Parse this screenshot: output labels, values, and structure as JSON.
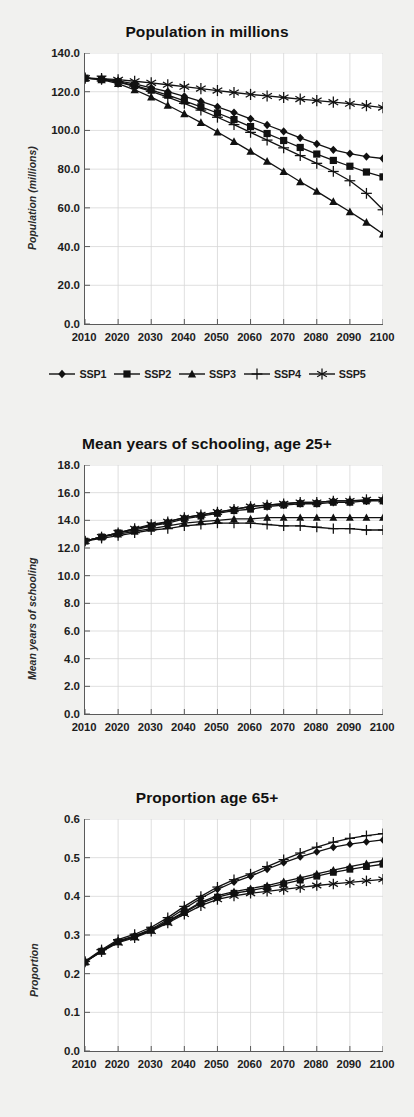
{
  "page": {
    "background": "#f1f1ef",
    "ink": "#111111",
    "plot_background": "#ffffff",
    "grid_color": "#d7d7d7",
    "axis_color": "#5a5a5a"
  },
  "legend": {
    "position": "below-first-chart",
    "items": [
      {
        "label": "SSP1",
        "marker": "diamond-marker"
      },
      {
        "label": "SSP2",
        "marker": "square-marker"
      },
      {
        "label": "SSP3",
        "marker": "triangle-marker"
      },
      {
        "label": "SSP4",
        "marker": "plus-marker"
      },
      {
        "label": "SSP5",
        "marker": "asterisk-marker"
      }
    ]
  },
  "chart_data": [
    {
      "id": "population",
      "type": "line",
      "title": "Population in millions",
      "xlabel": "",
      "ylabel": "Population (millions)",
      "xlim": [
        2010,
        2100
      ],
      "ylim": [
        0.0,
        140.0
      ],
      "ytick_step": 20.0,
      "yticks": [
        "0.0",
        "20.0",
        "40.0",
        "60.0",
        "80.0",
        "100.0",
        "120.0",
        "140.0"
      ],
      "xticks": [
        "2010",
        "2020",
        "2030",
        "2040",
        "2050",
        "2060",
        "2070",
        "2080",
        "2090",
        "2100"
      ],
      "x": [
        2010,
        2015,
        2020,
        2025,
        2030,
        2035,
        2040,
        2045,
        2050,
        2055,
        2060,
        2065,
        2070,
        2075,
        2080,
        2085,
        2090,
        2095,
        2100
      ],
      "grid": true,
      "legend": true,
      "series": [
        {
          "name": "SSP1",
          "marker": "diamond-marker",
          "values": [
            127.0,
            126.6,
            125.6,
            124.0,
            122.0,
            120.0,
            117.6,
            115.0,
            112.2,
            109.2,
            106.0,
            102.8,
            99.5,
            96.2,
            93.0,
            90.0,
            88.0,
            86.5,
            85.5
          ]
        },
        {
          "name": "SSP2",
          "marker": "square-marker",
          "values": [
            127.0,
            126.5,
            125.2,
            123.2,
            120.8,
            118.2,
            115.3,
            112.2,
            109.0,
            105.6,
            102.0,
            98.4,
            94.8,
            91.2,
            87.8,
            84.5,
            81.5,
            78.5,
            76.0
          ]
        },
        {
          "name": "SSP3",
          "marker": "triangle-marker",
          "values": [
            127.0,
            126.2,
            124.2,
            121.0,
            117.2,
            113.0,
            108.6,
            104.0,
            99.2,
            94.2,
            89.2,
            84.0,
            78.8,
            73.5,
            68.5,
            63.2,
            58.0,
            52.5,
            46.5
          ]
        },
        {
          "name": "SSP4",
          "marker": "plus-marker",
          "values": [
            127.0,
            126.4,
            125.0,
            122.8,
            120.2,
            117.2,
            114.0,
            110.5,
            106.8,
            103.0,
            99.0,
            95.0,
            91.0,
            87.0,
            83.0,
            78.8,
            74.0,
            67.5,
            59.0
          ]
        },
        {
          "name": "SSP5",
          "marker": "asterisk-marker",
          "values": [
            127.0,
            126.8,
            126.2,
            125.4,
            124.6,
            123.6,
            122.6,
            121.6,
            120.6,
            119.6,
            118.6,
            117.8,
            117.0,
            116.2,
            115.4,
            114.6,
            113.8,
            112.8,
            111.8
          ]
        }
      ]
    },
    {
      "id": "schooling",
      "type": "line",
      "title": "Mean years of schooling, age 25+",
      "xlabel": "",
      "ylabel": "Mean years of schooling",
      "xlim": [
        2010,
        2100
      ],
      "ylim": [
        0.0,
        18.0
      ],
      "ytick_step": 2.0,
      "yticks": [
        "0.0",
        "2.0",
        "4.0",
        "6.0",
        "8.0",
        "10.0",
        "12.0",
        "14.0",
        "16.0",
        "18.0"
      ],
      "xticks": [
        "2010",
        "2020",
        "2030",
        "2040",
        "2050",
        "2060",
        "2070",
        "2080",
        "2090",
        "2100"
      ],
      "x": [
        2010,
        2015,
        2020,
        2025,
        2030,
        2035,
        2040,
        2045,
        2050,
        2055,
        2060,
        2065,
        2070,
        2075,
        2080,
        2085,
        2090,
        2095,
        2100
      ],
      "grid": true,
      "legend": false,
      "series": [
        {
          "name": "SSP1",
          "marker": "diamond-marker",
          "values": [
            12.5,
            12.8,
            13.1,
            13.4,
            13.6,
            13.9,
            14.2,
            14.4,
            14.6,
            14.8,
            15.0,
            15.1,
            15.2,
            15.3,
            15.3,
            15.4,
            15.4,
            15.4,
            15.5
          ]
        },
        {
          "name": "SSP2",
          "marker": "square-marker",
          "values": [
            12.5,
            12.8,
            13.1,
            13.3,
            13.6,
            13.8,
            14.1,
            14.3,
            14.5,
            14.7,
            14.8,
            15.0,
            15.1,
            15.2,
            15.2,
            15.3,
            15.3,
            15.4,
            15.4
          ]
        },
        {
          "name": "SSP3",
          "marker": "triangle-marker",
          "values": [
            12.5,
            12.8,
            13.0,
            13.2,
            13.4,
            13.6,
            13.8,
            13.9,
            14.0,
            14.1,
            14.1,
            14.2,
            14.2,
            14.2,
            14.2,
            14.2,
            14.2,
            14.2,
            14.2
          ]
        },
        {
          "name": "SSP4",
          "marker": "plus-marker",
          "values": [
            12.5,
            12.7,
            12.9,
            13.1,
            13.3,
            13.4,
            13.6,
            13.7,
            13.8,
            13.8,
            13.8,
            13.7,
            13.6,
            13.6,
            13.5,
            13.4,
            13.4,
            13.3,
            13.3
          ]
        },
        {
          "name": "SSP5",
          "marker": "asterisk-marker",
          "values": [
            12.5,
            12.8,
            13.1,
            13.4,
            13.7,
            13.9,
            14.2,
            14.4,
            14.6,
            14.8,
            15.0,
            15.1,
            15.2,
            15.3,
            15.3,
            15.4,
            15.4,
            15.5,
            15.5
          ]
        }
      ]
    },
    {
      "id": "proportion65",
      "type": "line",
      "title": "Proportion age 65+",
      "xlabel": "",
      "ylabel": "Proportion",
      "xlim": [
        2010,
        2100
      ],
      "ylim": [
        0.0,
        0.6
      ],
      "ytick_step": 0.1,
      "yticks": [
        "0.0",
        "0.1",
        "0.2",
        "0.3",
        "0.4",
        "0.5",
        "0.6"
      ],
      "xticks": [
        "2010",
        "2020",
        "2030",
        "2040",
        "2050",
        "2060",
        "2070",
        "2080",
        "2090",
        "2100"
      ],
      "x": [
        2010,
        2015,
        2020,
        2025,
        2030,
        2035,
        2040,
        2045,
        2050,
        2055,
        2060,
        2065,
        2070,
        2075,
        2080,
        2085,
        2090,
        2095,
        2100
      ],
      "grid": true,
      "legend": false,
      "series": [
        {
          "name": "SSP1",
          "marker": "diamond-marker",
          "values": [
            0.23,
            0.26,
            0.285,
            0.298,
            0.315,
            0.34,
            0.368,
            0.395,
            0.418,
            0.437,
            0.452,
            0.47,
            0.487,
            0.502,
            0.515,
            0.527,
            0.535,
            0.541,
            0.546
          ]
        },
        {
          "name": "SSP2",
          "marker": "square-marker",
          "values": [
            0.23,
            0.258,
            0.282,
            0.295,
            0.312,
            0.334,
            0.358,
            0.382,
            0.398,
            0.408,
            0.415,
            0.423,
            0.432,
            0.442,
            0.452,
            0.462,
            0.47,
            0.477,
            0.483
          ]
        },
        {
          "name": "SSP3",
          "marker": "triangle-marker",
          "values": [
            0.23,
            0.258,
            0.283,
            0.296,
            0.313,
            0.336,
            0.36,
            0.385,
            0.402,
            0.412,
            0.42,
            0.428,
            0.438,
            0.448,
            0.458,
            0.468,
            0.477,
            0.485,
            0.492
          ]
        },
        {
          "name": "SSP4",
          "marker": "plus-marker",
          "values": [
            0.232,
            0.262,
            0.288,
            0.302,
            0.32,
            0.345,
            0.374,
            0.4,
            0.424,
            0.443,
            0.458,
            0.477,
            0.495,
            0.512,
            0.527,
            0.54,
            0.55,
            0.557,
            0.562
          ]
        },
        {
          "name": "SSP5",
          "marker": "asterisk-marker",
          "values": [
            0.23,
            0.257,
            0.28,
            0.293,
            0.31,
            0.331,
            0.354,
            0.376,
            0.392,
            0.401,
            0.408,
            0.413,
            0.418,
            0.423,
            0.428,
            0.432,
            0.436,
            0.44,
            0.444
          ]
        }
      ]
    }
  ]
}
